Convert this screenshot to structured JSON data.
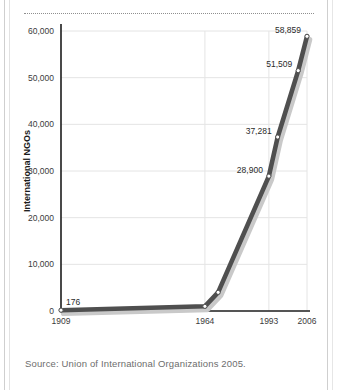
{
  "page": {
    "source_caption": "Source: Union of International Organizations 2005."
  },
  "chart_data": {
    "type": "line",
    "title": "",
    "xlabel": "",
    "ylabel": "International NGOs",
    "ylim": [
      0,
      60000
    ],
    "grid": true,
    "legend": "none",
    "y_ticks": [
      "0",
      "10,000",
      "20,000",
      "30,000",
      "40,000",
      "50,000",
      "60,000"
    ],
    "y_tick_values": [
      0,
      10000,
      20000,
      30000,
      40000,
      50000,
      60000
    ],
    "x_ticks": [
      "1909",
      "1964",
      "1993",
      "2006"
    ],
    "x_tick_values": [
      1909,
      1964,
      1993,
      2006
    ],
    "x": [
      1909,
      1964,
      1970,
      1993,
      1996,
      2003,
      2006
    ],
    "values": [
      176,
      1000,
      4000,
      28900,
      37281,
      51509,
      58859
    ],
    "point_labels": [
      "176",
      "",
      "",
      "28,900",
      "37,281",
      "51,509",
      "58,859"
    ],
    "series": [
      {
        "name": "International NGOs",
        "values": [
          176,
          1000,
          4000,
          28900,
          37281,
          51509,
          58859
        ]
      }
    ],
    "colors": {
      "line": "#4f4f4f",
      "shadow": "#c9c9c9",
      "marker_fill": "#ffffff",
      "marker_stroke": "#4f4f4f",
      "grid": "#e4e4e4",
      "axis": "#1c1c1c"
    }
  }
}
